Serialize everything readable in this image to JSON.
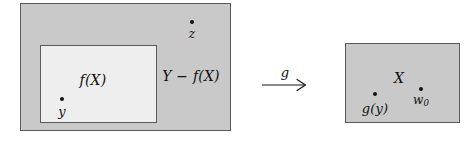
{
  "figure": {
    "type": "set-mapping-diagram",
    "colors": {
      "region_fill": "#c9c9c9",
      "subregion_fill": "#eeeeee",
      "stroke": "#5a5a5a",
      "text": "#111111",
      "background": "#ffffff"
    }
  },
  "left_panel": {
    "outer_region_name": "Y",
    "inner_region_label": "f(X)",
    "complement_label": "Y − f(X)",
    "points": [
      {
        "name": "y",
        "label": "y",
        "location": "inside f(X)"
      },
      {
        "name": "z",
        "label": "z",
        "location": "inside Y − f(X)"
      }
    ]
  },
  "arrow": {
    "label": "g",
    "direction": "left-to-right"
  },
  "right_panel": {
    "region_label": "X",
    "points": [
      {
        "name": "g(y)",
        "label": "g(y)"
      },
      {
        "name": "w0",
        "label_base": "w",
        "label_sub": "0"
      }
    ]
  }
}
